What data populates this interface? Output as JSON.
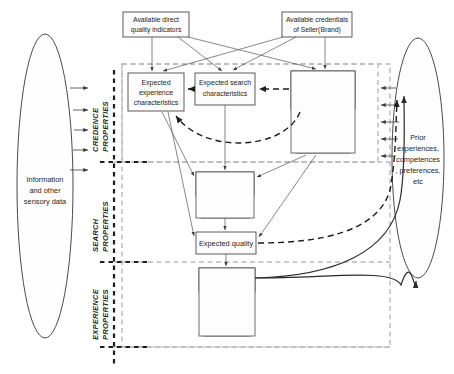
{
  "diagram": {
    "inputs": {
      "left_ellipse": "Information and other sensory data",
      "right_ellipse": "Prior experiences, competences, preferences, etc",
      "top_left_box": "Available direct quality indicators",
      "top_right_box": "Available credentials of Seller(Brand)"
    },
    "bands": [
      {
        "id": "credence",
        "label_line1": "CREDENCE",
        "label_line2": "PROPERTIES"
      },
      {
        "id": "search",
        "label_line1": "SEARCH",
        "label_line2": "PROPERTIES"
      },
      {
        "id": "experience",
        "label_line1": "EXPERIENCE",
        "label_line2": "PROPERTIES"
      }
    ],
    "nodes": [
      {
        "id": "expected-experience-characteristics",
        "lines": [
          "Expected",
          "experience",
          "characteristics"
        ],
        "sub": []
      },
      {
        "id": "expected-search-characteristics",
        "lines": [
          "Expected search",
          "characteristics"
        ],
        "sub": []
      },
      {
        "id": "expected-credence-characteristics",
        "lines": [
          "Expected",
          "credence",
          "characteristics"
        ],
        "sub": [
          {
            "id": "acceptability-factors",
            "lines": [
              "Acceptability",
              "Factors"
            ]
          },
          {
            "id": "satisfaction-factors",
            "lines": [
              "Satisfaction",
              "Factors"
            ]
          }
        ]
      },
      {
        "id": "experienced-search",
        "lines": [
          "Experienced",
          "Search"
        ],
        "sub": [
          {
            "id": "searchable-factors",
            "lines": [
              "Searchable",
              "Factors"
            ]
          }
        ]
      },
      {
        "id": "expected-quality",
        "lines": [
          "Expected quality"
        ],
        "sub": []
      },
      {
        "id": "experience-quality",
        "lines": [
          "Experience",
          "quality"
        ],
        "sub": [
          {
            "id": "design-factors",
            "lines": [
              "Design",
              "Factors"
            ]
          },
          {
            "id": "enjoyment-factors",
            "lines": [
              "Enjoyment",
              "Factors"
            ]
          }
        ]
      }
    ],
    "colors": {
      "stroke": "#3c3c3c",
      "region_grey": "#b9b9b9",
      "region_dark": "#1d1d1d",
      "box_fill": "#fcfcfc",
      "text": "#231f20",
      "background": "#ffffff"
    }
  }
}
